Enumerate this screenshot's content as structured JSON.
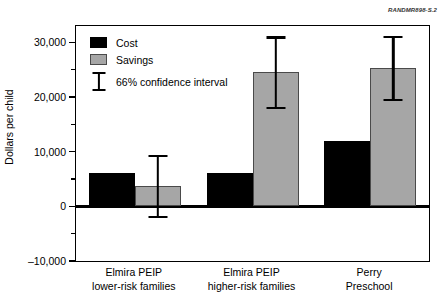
{
  "source_id": "RANDMR898-S.2",
  "chart_data": {
    "type": "bar",
    "title": "",
    "subtitle": "",
    "xlabel": "",
    "ylabel": "Dollars per child",
    "ylim": [
      -10000,
      33000
    ],
    "ytick_values": [
      -10000,
      0,
      10000,
      20000,
      30000
    ],
    "ytick_labels": [
      "–10,000",
      "0",
      "10,000",
      "20,000",
      "30,000"
    ],
    "yminor_tick_values": [
      -5000,
      5000,
      15000,
      25000
    ],
    "grid": false,
    "legend_position": "top-left",
    "categories": [
      "Elmira PEIP\nlower-risk families",
      "Elmira PEIP\nhigher-risk families",
      "Perry\nPreschool"
    ],
    "category_lines": [
      [
        "Elmira PEIP",
        "lower-risk families"
      ],
      [
        "Elmira PEIP",
        "higher-risk families"
      ],
      [
        "Perry",
        "Preschool"
      ]
    ],
    "series": [
      {
        "name": "Cost",
        "color": "#000000",
        "values": [
          6100,
          6100,
          12000
        ],
        "errors": [
          null,
          null,
          null
        ]
      },
      {
        "name": "Savings",
        "color": "#a6a6a6",
        "values": [
          3700,
          24600,
          25300
        ],
        "errors": [
          {
            "low": -2000,
            "high": 9200
          },
          {
            "low": 18000,
            "high": 30900
          },
          {
            "low": 19400,
            "high": 31000
          }
        ]
      }
    ],
    "annotations": {
      "confidence_level": "66% confidence interval"
    }
  },
  "legend": {
    "items": [
      {
        "label": "Cost",
        "marker": "filled-square-black"
      },
      {
        "label": "Savings",
        "marker": "filled-square-gray"
      },
      {
        "label": "66% confidence interval",
        "marker": "error-bar"
      }
    ]
  }
}
